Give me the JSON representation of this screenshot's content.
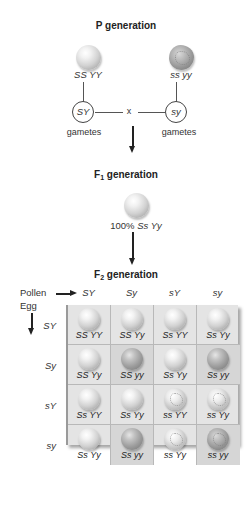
{
  "p_generation": {
    "title": "P generation",
    "parent_left": {
      "genotype": "SS YY",
      "phenotype": "round-yellow",
      "gamete": "SY"
    },
    "parent_right": {
      "genotype": "ss yy",
      "phenotype": "wrinkled-green",
      "gamete": "sy"
    },
    "cross_symbol": "x",
    "gametes_label": "gametes"
  },
  "f1_generation": {
    "title_prefix": "F",
    "title_sub": "1",
    "title_suffix": " generation",
    "result_percent": "100%",
    "result_genotype": "Ss Yy"
  },
  "f2_generation": {
    "title_prefix": "F",
    "title_sub": "2",
    "title_suffix": " generation",
    "pollen_label": "Pollen",
    "egg_label": "Egg",
    "pollen_gametes": [
      "SY",
      "Sy",
      "sY",
      "sy"
    ],
    "egg_gametes": [
      "SY",
      "Sy",
      "sY",
      "sy"
    ],
    "cells": [
      [
        {
          "g": "SS YY",
          "p": "yr"
        },
        {
          "g": "SS Yy",
          "p": "yr"
        },
        {
          "g": "Ss YY",
          "p": "yr"
        },
        {
          "g": "Ss Yy",
          "p": "yr"
        }
      ],
      [
        {
          "g": "SS Yy",
          "p": "yr"
        },
        {
          "g": "SS yy",
          "p": "gr"
        },
        {
          "g": "Ss Yy",
          "p": "yr"
        },
        {
          "g": "Ss yy",
          "p": "gr"
        }
      ],
      [
        {
          "g": "Ss YY",
          "p": "yr"
        },
        {
          "g": "Ss Yy",
          "p": "yr"
        },
        {
          "g": "ss YY",
          "p": "yw"
        },
        {
          "g": "ss Yy",
          "p": "yw"
        }
      ],
      [
        {
          "g": "Ss Yy",
          "p": "yr"
        },
        {
          "g": "Ss yy",
          "p": "gr"
        },
        {
          "g": "ss Yy",
          "p": "yw"
        },
        {
          "g": "ss yy",
          "p": "gw"
        }
      ]
    ]
  },
  "colors": {
    "background": "#ffffff",
    "grid_light": "#e4e4e4",
    "grid_dark": "#d6d6d6",
    "line": "#555555",
    "text": "#222222"
  }
}
